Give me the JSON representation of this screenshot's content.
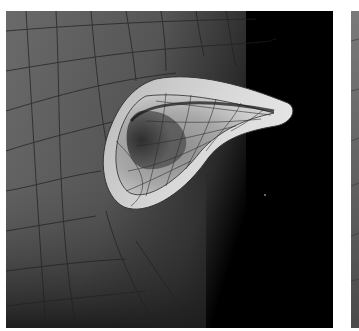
{
  "figure": {
    "panels": [
      {
        "id": "main",
        "description": "Shaded subdivision mesh of an ear-like protrusion on a head surface with quad wireframe overlay, dark background at right"
      },
      {
        "id": "side",
        "description": "Partially visible adjacent panel showing gray mesh surface"
      }
    ],
    "colors": {
      "background": "#ffffff",
      "surface_dark": "#3a3a3a",
      "surface_mid": "#6e6e6e",
      "surface_light": "#c8c8c8",
      "wire": "#1a1a1a",
      "void": "#000000"
    }
  }
}
